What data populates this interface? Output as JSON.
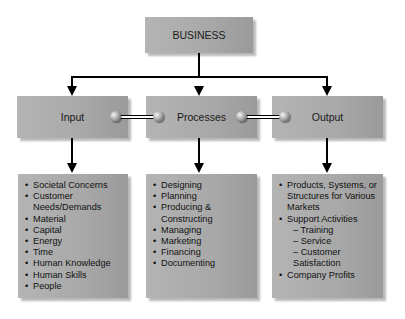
{
  "diagram": {
    "root": {
      "label": "BUSINESS"
    },
    "stages": [
      {
        "label": "Input"
      },
      {
        "label": "Processes"
      },
      {
        "label": "Output"
      }
    ],
    "details": {
      "input": [
        "Societal Concerns",
        "Customer Needs/Demands",
        "Material",
        "Capital",
        "Energy",
        "Time",
        "Human Knowledge",
        "Human Skills",
        "People"
      ],
      "processes": [
        "Designing",
        "Planning",
        "Producing & Constructing",
        "Managing",
        "Marketing",
        "Financing",
        "Documenting"
      ],
      "output": {
        "items": [
          "Products, Systems, or Structures for Various Markets",
          "Support Activities",
          "Company Profits"
        ],
        "support_subitems": [
          "– Training",
          "– Service",
          "– Customer Satisfaction"
        ]
      }
    },
    "colors": {
      "box_fill": "#a8a8a8",
      "line": "#000000",
      "background": "#ffffff"
    }
  }
}
